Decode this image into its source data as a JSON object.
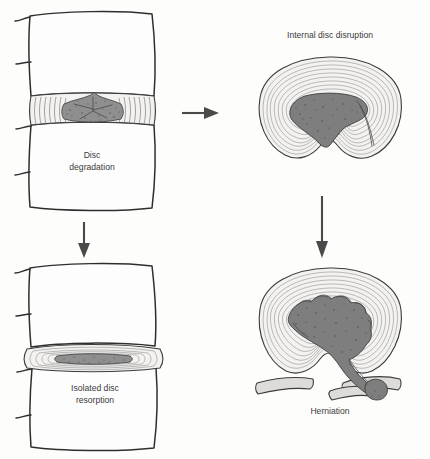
{
  "figure": {
    "background_color": "#fdfdfc",
    "ink_color": "#2e2e2e",
    "nucleus_color": "#8f8f8f",
    "arrow_color": "#4a4a4a"
  },
  "panels": [
    {
      "id": "disc-degradation",
      "view": "sagittal",
      "label_line1": "Disc",
      "label_line2": "degradation",
      "position": "top-left"
    },
    {
      "id": "internal-disc-disruption",
      "view": "axial",
      "label_line1": "Internal disc disruption",
      "label_line2": "",
      "position": "top-right"
    },
    {
      "id": "isolated-disc-resorption",
      "view": "sagittal",
      "label_line1": "Isolated disc",
      "label_line2": "resorption",
      "position": "bottom-left"
    },
    {
      "id": "herniation",
      "view": "axial",
      "label_line1": "Herniation",
      "label_line2": "",
      "position": "bottom-right"
    }
  ],
  "arrows": [
    {
      "id": "arrow-degradation-to-disruption",
      "direction": "right",
      "from": "disc-degradation",
      "to": "internal-disc-disruption"
    },
    {
      "id": "arrow-degradation-to-resorption",
      "direction": "down",
      "from": "disc-degradation",
      "to": "isolated-disc-resorption"
    },
    {
      "id": "arrow-disruption-to-herniation",
      "direction": "down",
      "from": "internal-disc-disruption",
      "to": "herniation"
    }
  ]
}
